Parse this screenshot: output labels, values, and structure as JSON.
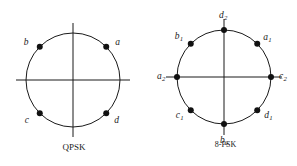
{
  "figure": {
    "background_color": "#ffffff",
    "stroke_color": "#1a1a1a",
    "point_color": "#111111"
  },
  "diagrams": [
    {
      "id": "qpsk",
      "caption": "QPSK",
      "type": "constellation",
      "center": [
        73,
        80
      ],
      "radius": 47,
      "axis_overhang": 10,
      "points": [
        {
          "label": "a",
          "sub": "",
          "angle_deg": 45,
          "label_dx": 9,
          "label_dy": -9
        },
        {
          "label": "b",
          "sub": "",
          "angle_deg": 135,
          "label_dx": -16,
          "label_dy": -9
        },
        {
          "label": "c",
          "sub": "",
          "angle_deg": 225,
          "label_dx": -15,
          "label_dy": 3
        },
        {
          "label": "d",
          "sub": "",
          "angle_deg": 315,
          "label_dx": 8,
          "label_dy": 3
        }
      ]
    },
    {
      "id": "8psk",
      "caption": "8-PSK",
      "caption_extra": "",
      "type": "constellation",
      "center": [
        76,
        77
      ],
      "radius": 47,
      "axis_overhang": 11,
      "points": [
        {
          "label": "c",
          "sub": "2",
          "angle_deg": 0,
          "label_dx": 8,
          "label_dy": -5
        },
        {
          "label": "a",
          "sub": "1",
          "angle_deg": 45,
          "label_dx": 6,
          "label_dy": -11
        },
        {
          "label": "d",
          "sub": "2",
          "angle_deg": 90,
          "label_dx": -5,
          "label_dy": -19
        },
        {
          "label": "b",
          "sub": "1",
          "angle_deg": 135,
          "label_dx": -16,
          "label_dy": -12
        },
        {
          "label": "a",
          "sub": "2",
          "angle_deg": 180,
          "label_dx": -20,
          "label_dy": -5
        },
        {
          "label": "c",
          "sub": "1",
          "angle_deg": 225,
          "label_dx": -15,
          "label_dy": 1
        },
        {
          "label": "b",
          "sub": "2",
          "angle_deg": 270,
          "label_dx": -4,
          "label_dy": 12
        },
        {
          "label": "d",
          "sub": "1",
          "angle_deg": 315,
          "label_dx": 7,
          "label_dy": 1
        }
      ]
    }
  ]
}
